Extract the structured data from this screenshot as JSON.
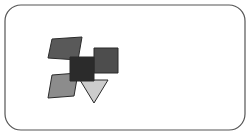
{
  "canvas": {
    "width": 250,
    "height": 135,
    "background_color": "#ffffff",
    "title": "Abstract geometric shape cluster"
  },
  "frame": {
    "name": "rounded-rectangle-border",
    "x": 5,
    "y": 5,
    "width": 240,
    "height": 125,
    "corner_radius": 16,
    "stroke_color": "#555555",
    "stroke_width": 1.2,
    "fill_color": "#ffffff"
  },
  "palette": {
    "near_black": "#2b2b2b",
    "dark_gray": "#595959",
    "medium_dark_gray": "#4d4d4d",
    "medium_gray": "#8c8c8c",
    "light_gray": "#cccccc",
    "outline": "#2b2b2b",
    "frame_stroke": "#555555",
    "background": "#ffffff"
  },
  "shapes": [
    {
      "id": "shape-1",
      "name": "top-left-parallelogram",
      "type": "parallelogram",
      "points": "52,39 82,37 78,60 48,58",
      "fill": "#595959",
      "stroke": "#2b2b2b",
      "stroke_width": 1,
      "label": "Dark gray slanted parallelogram, upper left"
    },
    {
      "id": "shape-2",
      "name": "right-square",
      "type": "square",
      "points": "94,48 118,48 118,73 94,73",
      "fill": "#4d4d4d",
      "stroke": "#2b2b2b",
      "stroke_width": 1,
      "label": "Medium dark gray square, right"
    },
    {
      "id": "shape-3",
      "name": "bottom-left-parallelogram",
      "type": "parallelogram",
      "points": "52,75 78,73 74,96 48,98",
      "fill": "#8c8c8c",
      "stroke": "#2b2b2b",
      "stroke_width": 1,
      "label": "Medium gray slanted parallelogram, lower left"
    },
    {
      "id": "shape-4",
      "name": "down-triangle",
      "type": "triangle",
      "points": "80,80 108,80 94,103",
      "fill": "#cccccc",
      "stroke": "#2b2b2b",
      "stroke_width": 1,
      "label": "Light gray downward-pointing triangle"
    },
    {
      "id": "shape-5",
      "name": "center-square",
      "type": "square",
      "points": "70,57 94,57 94,81 70,81",
      "fill": "#2b2b2b",
      "stroke": "#2b2b2b",
      "stroke_width": 1,
      "label": "Near-black center square, overlapping all others"
    }
  ],
  "shape_count": 5
}
